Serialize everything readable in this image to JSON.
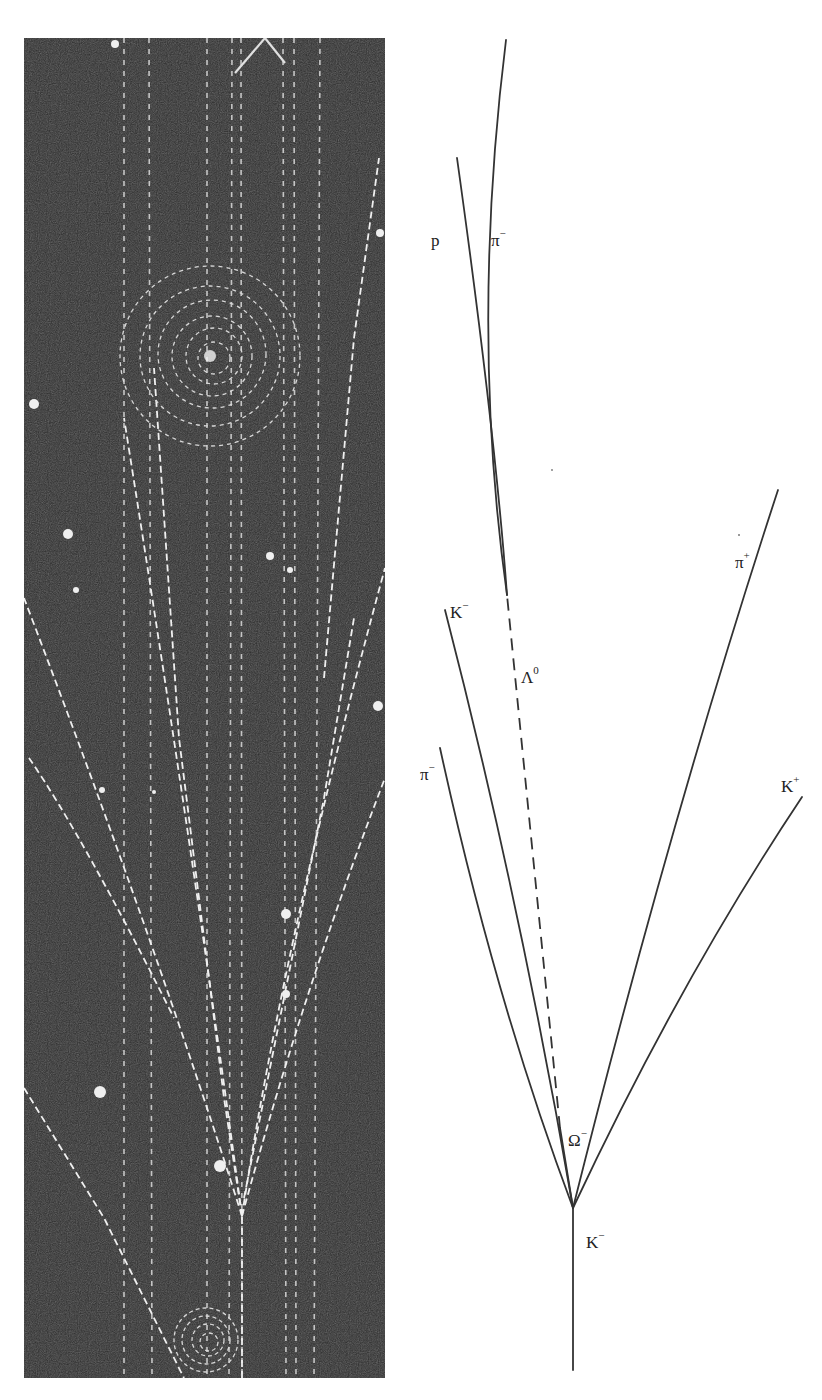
{
  "figure": {
    "photo": {
      "description": "Bubble chamber photograph (negative contrast, white tracks on dark background)",
      "background_color": "#2a2a2a",
      "track_color": "#e8e8e8"
    },
    "diagram": {
      "line_color": "#333333",
      "labels": {
        "p": {
          "base": "p",
          "sup": ""
        },
        "pi_minus_top": {
          "base": "π",
          "sup": "−"
        },
        "k_minus_upper": {
          "base": "K",
          "sup": "−"
        },
        "lambda0": {
          "base": "Λ",
          "sup": "0"
        },
        "pi_plus": {
          "base": "π",
          "sup": "+"
        },
        "pi_minus_left": {
          "base": "π",
          "sup": "−"
        },
        "k_plus": {
          "base": "K",
          "sup": "+"
        },
        "omega_minus": {
          "base": "Ω",
          "sup": "−"
        },
        "k_minus_beam": {
          "base": "K",
          "sup": "−"
        }
      }
    }
  }
}
